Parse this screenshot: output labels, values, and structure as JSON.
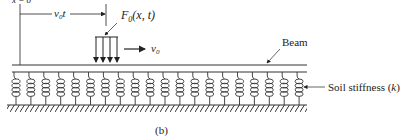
{
  "figure": {
    "top_cut_label": "x = 0",
    "distance_label": "v",
    "distance_sub": "0",
    "distance_t": "t",
    "force_label_F": "F",
    "force_label_sub": "0",
    "force_label_args": "(x, t)",
    "velocity_label": "v",
    "velocity_sub": "0",
    "beam_label": "Beam",
    "soil_label": "Soil stiffness (",
    "soil_k": "k",
    "soil_close": ")",
    "caption": "(b)",
    "spring_count": 20,
    "colors": {
      "ink": "#222222",
      "background": "#ffffff"
    }
  }
}
